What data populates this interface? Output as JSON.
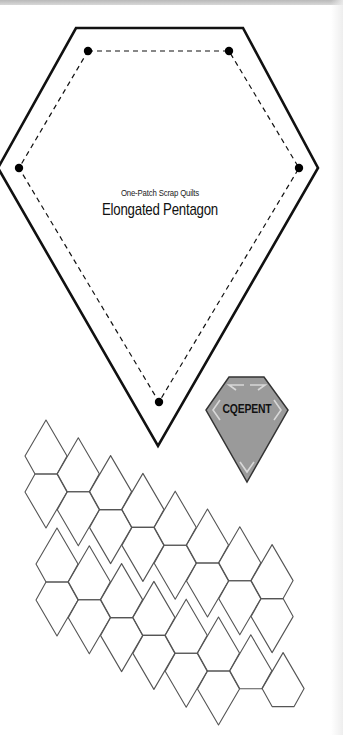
{
  "page": {
    "subtitle": "One-Patch Scrap Quilts",
    "title": "Elongated Pentagon"
  },
  "pattern_piece": {
    "outer_cut_line": [
      [
        76,
        28
      ],
      [
        243,
        28
      ],
      [
        318,
        168
      ],
      [
        158,
        446
      ],
      [
        -2,
        168
      ]
    ],
    "inner_sewing_line": [
      [
        88,
        51
      ],
      [
        229,
        51
      ],
      [
        299,
        168
      ],
      [
        159,
        402
      ],
      [
        19,
        168
      ]
    ],
    "corner_dots": [
      [
        88,
        51
      ],
      [
        229,
        51
      ],
      [
        299,
        168
      ],
      [
        159,
        402
      ],
      [
        19,
        168
      ]
    ],
    "stroke_color": "#111111"
  },
  "template": {
    "label": "CQEPENT",
    "outline": [
      [
        229,
        377
      ],
      [
        264,
        377
      ],
      [
        288,
        410
      ],
      [
        247,
        482
      ],
      [
        206,
        410
      ]
    ],
    "fill_color": "#9a9a9a",
    "stroke_color": "#333333"
  },
  "tessellation": {
    "stroke_color": "#555555",
    "pentagon_up_offsets": [
      [
        0,
        0
      ],
      [
        -21,
        36
      ],
      [
        -11,
        54
      ],
      [
        11,
        54
      ],
      [
        21,
        36
      ]
    ],
    "column_vector": [
      32.3,
      17.8
    ],
    "row_vector": [
      11,
      88
    ],
    "origin_apex": [
      46,
      420
    ],
    "columns": [
      {
        "col": 0,
        "tiles": [
          "U0",
          "D0",
          "U1",
          "D1"
        ]
      },
      {
        "col": 1,
        "tiles": [
          "U0",
          "D0",
          "U1",
          "D1"
        ]
      },
      {
        "col": 2,
        "tiles": [
          "U0",
          "D0",
          "U1",
          "D1"
        ]
      },
      {
        "col": 3,
        "tiles": [
          "U0",
          "D0",
          "U1",
          "D1"
        ]
      },
      {
        "col": 4,
        "tiles": [
          "U0",
          "D0",
          "U1",
          "D1"
        ]
      },
      {
        "col": 5,
        "tiles": [
          "U0",
          "D0",
          "U1",
          "D1"
        ]
      },
      {
        "col": 6,
        "tiles": [
          "U0",
          "D0",
          "U1"
        ]
      },
      {
        "col": 7,
        "tiles": [
          "U0",
          "D0",
          "U1"
        ]
      }
    ]
  }
}
